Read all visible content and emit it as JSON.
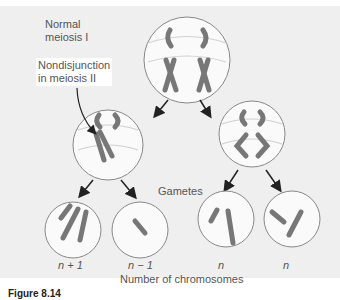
{
  "labels": {
    "normal_meiosis": [
      "Normal",
      "meiosis I"
    ],
    "nondisjunction": [
      "Nondisjunction",
      "in meiosis II"
    ],
    "gametes": "Gametes",
    "axis_title": "Number of chromosomes"
  },
  "gametes": [
    {
      "label": "n + 1"
    },
    {
      "label": "n − 1"
    },
    {
      "label": "n"
    },
    {
      "label": "n"
    }
  ],
  "caption": "Figure 8.14",
  "colors": {
    "background": "#efefef",
    "chromosome": "#7a7a7a",
    "cell_outline": "#888888",
    "spindle": "#cfcfcf",
    "arrow": "#222222"
  }
}
